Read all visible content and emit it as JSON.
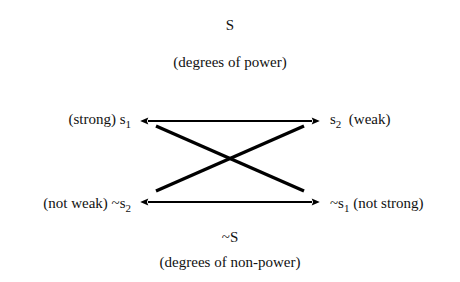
{
  "diagram": {
    "title_symbol": "S",
    "title_caption": "(degrees of power)",
    "footer_symbol": "~S",
    "footer_caption": "(degrees of non-power)",
    "stroke_color": "#000000",
    "background_color": "#ffffff",
    "corners": {
      "top_left": {
        "gloss": "(strong)",
        "term_base": "s",
        "term_sub": "1"
      },
      "top_right": {
        "gloss": "(weak)",
        "term_base": "s",
        "term_sub": "2"
      },
      "bottom_left": {
        "gloss": "(not weak)",
        "term_base": "~s",
        "term_sub": "2"
      },
      "bottom_right": {
        "gloss": "(not strong)",
        "term_base": "~s",
        "term_sub": "1"
      }
    },
    "edges": [
      {
        "name": "top-horizontal-arrow",
        "from": "top_left",
        "to": "top_right",
        "style": "double-headed-arrow"
      },
      {
        "name": "bottom-horizontal-arrow",
        "from": "bottom_left",
        "to": "bottom_right",
        "style": "double-headed-arrow"
      },
      {
        "name": "diagonal-top-left-to-bottom-right",
        "from": "top_left",
        "to": "bottom_right",
        "style": "plain-line"
      },
      {
        "name": "diagonal-bottom-left-to-top-right",
        "from": "bottom_left",
        "to": "top_right",
        "style": "plain-line"
      }
    ]
  }
}
